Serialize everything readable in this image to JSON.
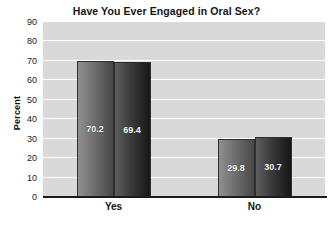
{
  "chart_data": {
    "type": "bar",
    "title": "Have You Ever Engaged in Oral Sex?",
    "xlabel": "",
    "ylabel": "Percent",
    "categories": [
      "Yes",
      "No"
    ],
    "series": [
      {
        "name": "Male",
        "values": [
          70.2,
          29.8
        ],
        "color": "#6f6f6f"
      },
      {
        "name": "Female",
        "values": [
          69.4,
          30.7
        ],
        "color": "#2a2a2a"
      }
    ],
    "ylim": [
      0,
      90
    ],
    "yticks": [
      0,
      10,
      20,
      30,
      40,
      50,
      60,
      70,
      80,
      90
    ],
    "ytick_labels": [
      "0",
      "10",
      "20",
      "30",
      "40",
      "50",
      "60",
      "70",
      "80",
      "90"
    ],
    "grid": true,
    "grid_axis": "y",
    "grid_color": "#ffffff",
    "plot_background": "#d9d9d9",
    "figure_background": "#ffffff",
    "legend_position": "top-right",
    "data_labels": [
      "70.2",
      "69.4",
      "29.8",
      "30.7"
    ],
    "value_label_color": "#ffffff"
  },
  "legend": {
    "entries": [
      {
        "label": "Male"
      },
      {
        "label": "Female"
      }
    ]
  }
}
